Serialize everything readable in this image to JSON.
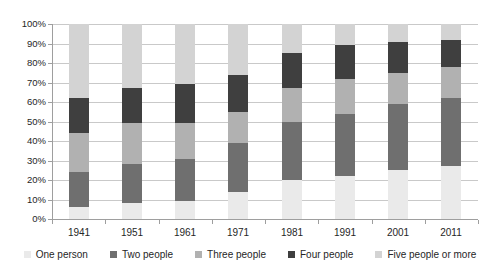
{
  "chart_data": {
    "type": "bar",
    "stacked": true,
    "title": "",
    "xlabel": "",
    "ylabel": "",
    "ylim": [
      0,
      100
    ],
    "ytick_step": 10,
    "ytick_suffix": "%",
    "grid": true,
    "legend_position": "bottom",
    "categories": [
      "1941",
      "1951",
      "1961",
      "1971",
      "1981",
      "1991",
      "2001",
      "2011"
    ],
    "series": [
      {
        "name": "One person",
        "color": "#eaeaea",
        "values": [
          6,
          8,
          9,
          14,
          20,
          22,
          25,
          27
        ]
      },
      {
        "name": "Two people",
        "color": "#6f6f6f",
        "values": [
          18,
          20,
          22,
          25,
          30,
          32,
          34,
          35
        ]
      },
      {
        "name": "Three people",
        "color": "#b1b1b1",
        "values": [
          20,
          21,
          18,
          16,
          17,
          18,
          16,
          16
        ]
      },
      {
        "name": "Four people",
        "color": "#3f3f3f",
        "values": [
          18,
          18,
          20,
          19,
          18,
          17,
          16,
          14
        ]
      },
      {
        "name": "Five people or more",
        "color": "#d3d3d3",
        "values": [
          38,
          33,
          31,
          26,
          15,
          11,
          9,
          8
        ]
      }
    ],
    "y_tick_labels": [
      "0%",
      "10%",
      "20%",
      "30%",
      "40%",
      "50%",
      "60%",
      "70%",
      "80%",
      "90%",
      "100%"
    ],
    "grid_color": "#c9c9c9",
    "axis_color": "#9e9e9e",
    "text_color": "#262626",
    "background_color": "#ffffff"
  }
}
